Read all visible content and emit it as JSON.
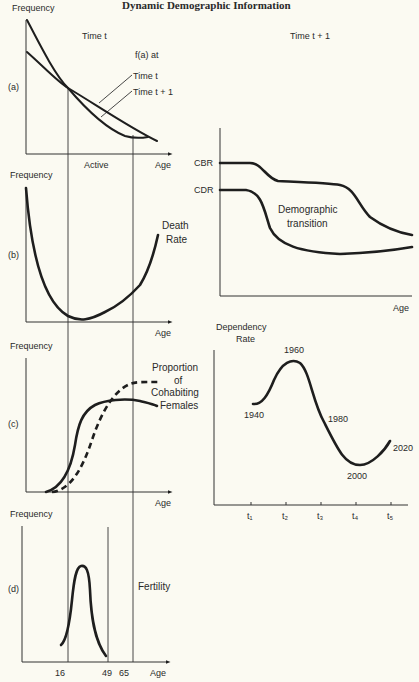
{
  "title": "Dynamic Demographic Information",
  "panels": {
    "a": {
      "label": "(a)",
      "ylabel": "Frequency",
      "xlabel": "Age",
      "header": "Time t",
      "legend_title": "f(a) at",
      "legend_items": [
        "Time t",
        "Time t + 1"
      ],
      "interval_label": "Active"
    },
    "b": {
      "label": "(b)",
      "ylabel": "Frequency",
      "xlabel": "Age",
      "curve_label_line1": "Death",
      "curve_label_line2": "Rate"
    },
    "c": {
      "label": "(c)",
      "ylabel": "Frequency",
      "xlabel": "Age",
      "curve_label_lines": [
        "Proportion",
        "of",
        "Cohabiting",
        "Females"
      ]
    },
    "d": {
      "label": "(d)",
      "ylabel": "Frequency",
      "xlabel": "Age",
      "curve_label": "Fertility",
      "ticks": [
        "16",
        "49",
        "65"
      ]
    },
    "transition": {
      "header": "Time t + 1",
      "series_labels": [
        "CBR",
        "CDR"
      ],
      "annotation_line1": "Demographic",
      "annotation_line2": "transition",
      "xlabel": "Age"
    },
    "dependency": {
      "ylabel_line1": "Dependency",
      "ylabel_line2": "Rate",
      "ticks": [
        "t₁",
        "t₂",
        "t₃",
        "t₄",
        "t₅"
      ],
      "point_labels": [
        "1940",
        "1960",
        "1980",
        "2000",
        "2020"
      ]
    }
  },
  "chart_data": [
    {
      "type": "line",
      "title": "(a) Age distribution f(a)",
      "xlabel": "Age",
      "ylabel": "Frequency",
      "series": [
        {
          "name": "Time t",
          "shape": "steeply decreasing, crosses Time t+1 near age 16, flattens at older ages"
        },
        {
          "name": "Time t + 1",
          "shape": "gently decreasing, nearly linear"
        }
      ],
      "annotations": [
        "Active (16 to 65)"
      ]
    },
    {
      "type": "line",
      "title": "(b) Death Rate",
      "xlabel": "Age",
      "ylabel": "Frequency",
      "series": [
        {
          "name": "Death Rate",
          "shape": "U-shaped: high at birth, minimum in early active ages, rising at old age"
        }
      ]
    },
    {
      "type": "line",
      "title": "(c) Proportion of Cohabiting Females",
      "xlabel": "Age",
      "ylabel": "Frequency",
      "series": [
        {
          "name": "Time t (solid)",
          "shape": "sigmoid rising after 16, plateau then slight decline"
        },
        {
          "name": "Time t + 1 (dashed)",
          "shape": "later sigmoid rising to higher plateau by 65"
        }
      ]
    },
    {
      "type": "line",
      "title": "(d) Fertility",
      "xlabel": "Age",
      "ylabel": "Frequency",
      "x_ticks": [
        16,
        49,
        65
      ],
      "series": [
        {
          "name": "Fertility",
          "shape": "bell-shaped between ages 16 and 49, peak in early 20s"
        }
      ]
    },
    {
      "type": "line",
      "title": "Demographic transition (Time t + 1)",
      "xlabel": "Age",
      "series": [
        {
          "name": "CBR",
          "shape": "high plateau, step down, plateau, then decline"
        },
        {
          "name": "CDR",
          "shape": "high plateau, sharp decline, low trough, slight rise"
        }
      ]
    },
    {
      "type": "line",
      "title": "Dependency Rate",
      "ylabel": "Dependency Rate",
      "x": [
        "t1",
        "t2",
        "t3",
        "t4",
        "t5"
      ],
      "series": [
        {
          "name": "Dependency Rate",
          "points": [
            {
              "x": "t1",
              "year": 1940,
              "relative_level": 0.6
            },
            {
              "x": "t2",
              "year": 1960,
              "relative_level": 0.95
            },
            {
              "x": "t3",
              "year": 1980,
              "relative_level": 0.5
            },
            {
              "x": "t4",
              "year": 2000,
              "relative_level": 0.2
            },
            {
              "x": "t5",
              "year": 2020,
              "relative_level": 0.38
            }
          ]
        }
      ]
    }
  ]
}
